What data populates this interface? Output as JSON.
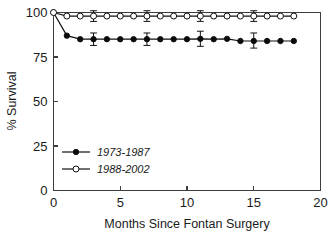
{
  "chart_data": {
    "type": "line",
    "title": "",
    "xlabel": "Months Since Fontan Surgery",
    "ylabel": "% Survival",
    "xlim": [
      0,
      20
    ],
    "ylim": [
      0,
      100
    ],
    "xticks": [
      "0",
      "5",
      "10",
      "15",
      "20"
    ],
    "yticks": [
      "0",
      "25",
      "50",
      "75",
      "100"
    ],
    "xtick_values": [
      0,
      5,
      10,
      15,
      20
    ],
    "ytick_values": [
      0,
      25,
      50,
      75,
      100
    ],
    "grid": false,
    "legend_position": "lower-left-inside",
    "series": [
      {
        "name": "1973-1987",
        "marker": "filled-circle",
        "x": [
          0,
          1,
          2,
          3,
          4,
          5,
          6,
          7,
          8,
          9,
          10,
          11,
          12,
          13,
          14,
          15,
          16,
          17,
          18
        ],
        "values": [
          100,
          87,
          85,
          85,
          85,
          85,
          85,
          85,
          85,
          85,
          85,
          85.2,
          85,
          85.2,
          84,
          84,
          84,
          84,
          84
        ],
        "errors": [
          {
            "x": 3,
            "y": 85,
            "low": 81.5,
            "high": 88.5
          },
          {
            "x": 7,
            "y": 85,
            "low": 81.5,
            "high": 88.5
          },
          {
            "x": 11,
            "y": 85.2,
            "low": 81,
            "high": 89.5
          },
          {
            "x": 15,
            "y": 84,
            "low": 80,
            "high": 88.5
          }
        ]
      },
      {
        "name": "1988-2002",
        "marker": "open-circle",
        "x": [
          0,
          1,
          2,
          3,
          4,
          5,
          6,
          7,
          8,
          9,
          10,
          11,
          12,
          13,
          14,
          15,
          16,
          17,
          18
        ],
        "values": [
          100,
          98,
          98,
          98,
          98,
          98,
          98,
          98,
          98,
          98,
          98,
          98,
          98,
          98,
          98,
          98,
          98,
          98,
          98
        ],
        "errors": [
          {
            "x": 3,
            "y": 98,
            "low": 95,
            "high": 101
          },
          {
            "x": 7,
            "y": 98,
            "low": 95,
            "high": 101
          },
          {
            "x": 11,
            "y": 98,
            "low": 95,
            "high": 101
          },
          {
            "x": 15,
            "y": 98,
            "low": 95,
            "high": 101
          }
        ]
      }
    ],
    "legend": [
      {
        "label": "1973-1987",
        "marker": "filled-circle"
      },
      {
        "label": "1988-2002",
        "marker": "open-circle"
      }
    ],
    "colors": {
      "series": "#111111",
      "axis": "#3d3d3d",
      "background": "#ffffff",
      "text": "#1a1a1a"
    }
  }
}
